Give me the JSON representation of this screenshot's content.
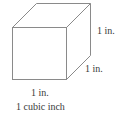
{
  "diagram": {
    "title": "1 cubic inch",
    "labels": {
      "height": "1 in.",
      "depth": "1 in.",
      "width": "1 in."
    },
    "stroke_color": "#8a8a8a"
  }
}
